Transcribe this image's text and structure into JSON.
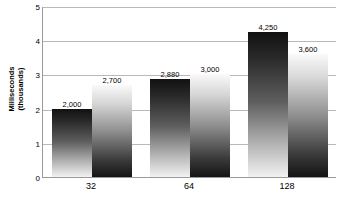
{
  "chart_data": {
    "type": "bar",
    "title": "",
    "subtitle": "",
    "xlabel": "",
    "ylabel": "Milliseconds (thousands)",
    "categories": [
      "32",
      "64",
      "128"
    ],
    "series": [
      {
        "name": "Series 1",
        "values": [
          2.0,
          2.88,
          4.25
        ],
        "labels": [
          "2,000",
          "2,880",
          "4,250"
        ],
        "fill": "gradient-dark-to-light"
      },
      {
        "name": "Series 2",
        "values": [
          2.7,
          3.0,
          3.6
        ],
        "labels": [
          "2,700",
          "3,000",
          "3,600"
        ],
        "fill": "gradient-light-to-dark"
      }
    ],
    "ylim": [
      0,
      5
    ],
    "yticks": [
      0,
      1,
      2,
      3,
      4,
      5
    ],
    "ytick_labels": [
      "0",
      "1",
      "2",
      "3",
      "4",
      "5"
    ],
    "grid": true,
    "grid_axis": "y",
    "legend": false,
    "legend_position": "none",
    "data_labels": true,
    "colors": {
      "grid": "#b9b9b9",
      "axis": "#9a9a9a",
      "text": "#000000",
      "background": "#ffffff",
      "series1_top": "#111111",
      "series1_bottom": "#f2f2f2",
      "series2_top": "#fafafa",
      "series2_bottom": "#141414"
    }
  },
  "axis_labels": {
    "y_title_line1": "Milliseconds",
    "y_title_line2": "(thousands)"
  }
}
